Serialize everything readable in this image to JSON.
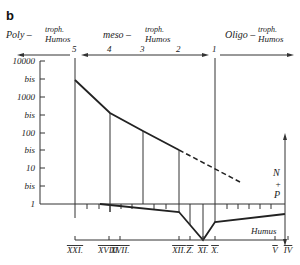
{
  "panel_label": "b",
  "header": {
    "poly": {
      "prefix": "Poly –",
      "top": "troph.",
      "bottom": "Humos"
    },
    "meso": {
      "prefix": "meso –",
      "top": "troph.",
      "bottom": "Humos"
    },
    "oligo": {
      "prefix": "Oligo –",
      "top": "troph.",
      "bottom": "Humos"
    },
    "stage_numbers": [
      "5",
      "4",
      "3",
      "2",
      "1"
    ]
  },
  "y_axis": {
    "ticks": [
      "10000",
      "bis",
      "1000",
      "bis",
      "100",
      "bis",
      "10",
      "bis",
      "1"
    ]
  },
  "right_axis": {
    "upper_label": [
      "N",
      "+",
      "P"
    ],
    "lower_label": "Humus"
  },
  "bottom_labels": [
    "XXI.",
    "XVIII.",
    "XVII.",
    "XII.",
    "Z.",
    "XI.",
    "X.",
    "V",
    "IV"
  ]
}
